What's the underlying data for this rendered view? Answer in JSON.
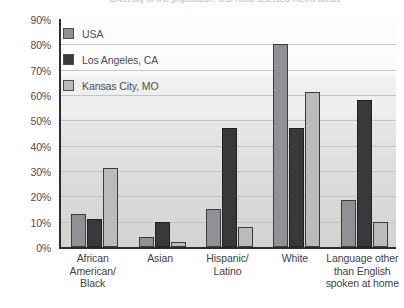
{
  "figure": {
    "clipped_title": "Diversity of the population, USA and selected metro areas",
    "legend_position": "top-left inside plot",
    "grid": true
  },
  "legend": {
    "items": [
      {
        "label": "USA",
        "color": "#8f9194",
        "swatch": "legend-swatch-usa"
      },
      {
        "label": "Los Angeles, CA",
        "color": "#37393b",
        "swatch": "legend-swatch-los-angeles"
      },
      {
        "label": "Kansas City, MO",
        "color": "#b9bbbd",
        "swatch": "legend-swatch-kansas-city"
      }
    ]
  },
  "y_axis": {
    "ticks": [
      "90%",
      "80%",
      "70%",
      "60%",
      "50%",
      "40%",
      "30%",
      "20%",
      "10%",
      "0%"
    ]
  },
  "x_axis": {
    "categories": [
      {
        "lines": [
          "African",
          "American/",
          "Black"
        ]
      },
      {
        "lines": [
          "Asian"
        ]
      },
      {
        "lines": [
          "Hispanic/",
          "Latino"
        ]
      },
      {
        "lines": [
          "White"
        ]
      },
      {
        "lines": [
          "Language other",
          "than English",
          "spoken at home"
        ]
      }
    ]
  },
  "chart_data": {
    "type": "bar",
    "title": "Diversity of the population, USA and selected metro areas",
    "xlabel": "",
    "ylabel": "",
    "ylim": [
      0,
      90
    ],
    "ytick_step": 10,
    "ytick_format": "percent",
    "grid": true,
    "legend_position": "upper left",
    "categories": [
      "African American/ Black",
      "Asian",
      "Hispanic/ Latino",
      "White",
      "Language other than English spoken at home"
    ],
    "series": [
      {
        "name": "USA",
        "color": "#8f9194",
        "values": [
          13,
          4,
          15,
          80,
          18.5
        ]
      },
      {
        "name": "Los Angeles, CA",
        "color": "#37393b",
        "values": [
          11,
          10,
          47,
          47,
          58
        ]
      },
      {
        "name": "Kansas City, MO",
        "color": "#b9bbbd",
        "values": [
          31,
          2,
          8,
          61,
          10
        ]
      }
    ]
  }
}
